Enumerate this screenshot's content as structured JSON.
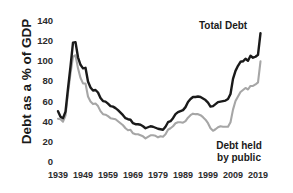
{
  "chart_data": {
    "type": "line",
    "title": "",
    "xlabel": "",
    "ylabel": "Debt as a % of GDP",
    "xlim": [
      1939,
      2021
    ],
    "ylim": [
      0,
      140
    ],
    "ytick_labels": [
      "140",
      "120",
      "100",
      "80",
      "60",
      "40",
      "20",
      "0"
    ],
    "ytick_values": [
      140,
      120,
      100,
      80,
      60,
      40,
      20,
      0
    ],
    "xtick_labels": [
      "1939",
      "1949",
      "1959",
      "1969",
      "1979",
      "1989",
      "1999",
      "2009",
      "2019"
    ],
    "xtick_values": [
      1939,
      1949,
      1959,
      1969,
      1979,
      1989,
      1999,
      2009,
      2019
    ],
    "grid": false,
    "legend_position": "inline-annotations",
    "x": [
      1939,
      1940,
      1941,
      1942,
      1943,
      1944,
      1945,
      1946,
      1947,
      1948,
      1949,
      1950,
      1951,
      1952,
      1953,
      1954,
      1955,
      1956,
      1957,
      1958,
      1959,
      1960,
      1961,
      1962,
      1963,
      1964,
      1965,
      1966,
      1967,
      1968,
      1969,
      1970,
      1971,
      1972,
      1973,
      1974,
      1975,
      1976,
      1977,
      1978,
      1979,
      1980,
      1981,
      1982,
      1983,
      1984,
      1985,
      1986,
      1987,
      1988,
      1989,
      1990,
      1991,
      1992,
      1993,
      1994,
      1995,
      1996,
      1997,
      1998,
      1999,
      2000,
      2001,
      2002,
      2003,
      2004,
      2005,
      2006,
      2007,
      2008,
      2009,
      2010,
      2011,
      2012,
      2013,
      2014,
      2015,
      2016,
      2017,
      2018,
      2019,
      2020
    ],
    "series": [
      {
        "name": "Total Debt",
        "color": "#1a1a1a",
        "label": "Total Debt",
        "values": [
          50.5,
          45.0,
          43.5,
          50.0,
          73.0,
          95.0,
          118.5,
          119.0,
          104.0,
          96.5,
          93.0,
          93.5,
          80.0,
          74.0,
          71.0,
          71.5,
          69.0,
          63.5,
          60.5,
          60.0,
          58.0,
          55.5,
          55.0,
          53.5,
          51.5,
          49.0,
          46.5,
          43.5,
          42.5,
          42.0,
          38.5,
          37.5,
          37.5,
          37.0,
          35.5,
          33.5,
          34.5,
          35.5,
          35.0,
          34.0,
          33.0,
          32.5,
          32.0,
          35.0,
          39.5,
          40.5,
          43.5,
          47.5,
          49.5,
          50.5,
          51.5,
          54.5,
          59.5,
          62.5,
          64.5,
          64.5,
          65.0,
          64.5,
          63.0,
          61.5,
          59.0,
          55.0,
          55.5,
          57.5,
          59.5,
          60.0,
          60.5,
          61.0,
          62.5,
          67.5,
          82.5,
          90.5,
          95.5,
          99.5,
          100.0,
          102.5,
          100.5,
          105.5,
          103.5,
          104.5,
          106.5,
          128.0
        ]
      },
      {
        "name": "Debt held by public",
        "color": "#a6a6a6",
        "label": "Debt held by public",
        "values": [
          43.0,
          42.5,
          40.0,
          46.0,
          68.5,
          88.0,
          104.5,
          106.0,
          93.0,
          83.5,
          78.0,
          78.0,
          65.0,
          60.0,
          57.5,
          58.0,
          55.5,
          50.5,
          47.5,
          47.0,
          45.5,
          43.5,
          43.0,
          42.5,
          40.5,
          38.5,
          36.5,
          33.5,
          31.5,
          32.0,
          28.5,
          27.5,
          27.5,
          26.5,
          25.5,
          23.5,
          25.0,
          26.5,
          26.5,
          26.0,
          24.5,
          25.5,
          25.0,
          27.5,
          32.0,
          33.5,
          35.5,
          38.5,
          39.5,
          39.5,
          39.0,
          40.5,
          44.0,
          46.5,
          48.0,
          47.5,
          47.5,
          46.5,
          44.5,
          42.0,
          38.5,
          33.5,
          31.0,
          32.5,
          34.5,
          35.5,
          35.0,
          35.0,
          35.0,
          39.5,
          52.0,
          60.5,
          65.0,
          69.5,
          71.5,
          73.5,
          72.0,
          75.5,
          75.5,
          77.0,
          79.0,
          100.0
        ]
      }
    ],
    "annotations": [
      {
        "name": "total-debt-annotation",
        "text": "Total Debt"
      },
      {
        "name": "public-debt-annotation",
        "text": "Debt held by public"
      }
    ]
  },
  "labels": {
    "y_axis_title": "Debt as a % of GDP",
    "total_debt": "Total Debt",
    "public_debt_line1": "Debt held",
    "public_debt_line2": "by public"
  }
}
